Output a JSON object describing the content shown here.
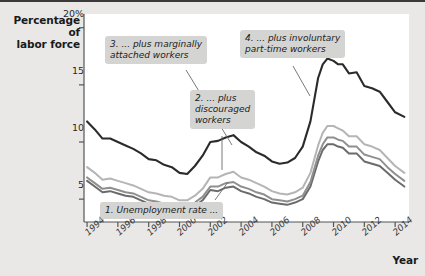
{
  "figure": {
    "y_axis_title": "Percentage of\nlabor force",
    "x_axis_title": "Year",
    "y_ticks": [
      {
        "value": 20,
        "label": "20%"
      },
      {
        "value": 15,
        "label": "15"
      },
      {
        "value": 10,
        "label": "10"
      },
      {
        "value": 5,
        "label": "5"
      }
    ],
    "x_ticks": [
      {
        "value": 1994,
        "label": "1994"
      },
      {
        "value": 1996,
        "label": "1996"
      },
      {
        "value": 1998,
        "label": "1998"
      },
      {
        "value": 2000,
        "label": "2000"
      },
      {
        "value": 2002,
        "label": "2002"
      },
      {
        "value": 2004,
        "label": "2004"
      },
      {
        "value": 2006,
        "label": "2006"
      },
      {
        "value": 2008,
        "label": "2008"
      },
      {
        "value": 2010,
        "label": "2010"
      },
      {
        "value": 2012,
        "label": "2012"
      },
      {
        "value": 2014,
        "label": "2014"
      }
    ],
    "annotations": [
      {
        "id": "note1",
        "text": "1. Unemployment rate ..."
      },
      {
        "id": "note2",
        "text": "2. ... plus\ndiscouraged\nworkers"
      },
      {
        "id": "note3",
        "text": "3. ... plus marginally\nattached workers"
      },
      {
        "id": "note4",
        "text": "4. ... plus involuntary\npart-time workers"
      }
    ],
    "colors": {
      "plot_background": "#ffffff",
      "page_background": "#e9e8e6",
      "note_background": "#d4d4d2",
      "axis": "#555555",
      "series_1": "#6b6b6b",
      "series_2": "#8f8f8f",
      "series_3": "#b5b5b5",
      "series_4": "#2b2b2b"
    }
  },
  "chart_data": {
    "type": "line",
    "title": "",
    "xlabel": "Year",
    "ylabel": "Percentage of labor force",
    "xlim": [
      1993.8,
      2014.9
    ],
    "ylim": [
      3.0,
      21.2
    ],
    "grid": false,
    "legend": "annotations-inline",
    "x": [
      1994.0,
      1994.5,
      1995.0,
      1995.5,
      1996.0,
      1996.5,
      1997.0,
      1997.5,
      1998.0,
      1998.5,
      1999.0,
      1999.5,
      2000.0,
      2000.5,
      2001.0,
      2001.5,
      2002.0,
      2002.5,
      2003.0,
      2003.5,
      2004.0,
      2004.5,
      2005.0,
      2005.5,
      2006.0,
      2006.5,
      2007.0,
      2007.5,
      2008.0,
      2008.5,
      2009.0,
      2009.3,
      2009.6,
      2010.0,
      2010.3,
      2010.6,
      2011.0,
      2011.5,
      2012.0,
      2012.5,
      2013.0,
      2013.5,
      2014.0,
      2014.6
    ],
    "series": [
      {
        "name": "1. Unemployment rate (U-3)",
        "color": "#6b6b6b",
        "values": [
          6.6,
          6.1,
          5.6,
          5.7,
          5.5,
          5.3,
          5.2,
          4.9,
          4.6,
          4.5,
          4.3,
          4.2,
          4.0,
          4.0,
          4.4,
          4.9,
          5.8,
          5.7,
          6.0,
          6.1,
          5.7,
          5.5,
          5.2,
          5.0,
          4.7,
          4.6,
          4.5,
          4.7,
          5.0,
          6.1,
          8.3,
          9.3,
          9.8,
          9.8,
          9.6,
          9.5,
          9.0,
          9.0,
          8.3,
          8.1,
          7.9,
          7.3,
          6.7,
          6.1
        ]
      },
      {
        "name": "2. ... plus discouraged workers",
        "color": "#8f8f8f",
        "values": [
          6.9,
          6.4,
          5.9,
          6.0,
          5.8,
          5.6,
          5.5,
          5.2,
          4.9,
          4.8,
          4.6,
          4.5,
          4.3,
          4.3,
          4.7,
          5.2,
          6.1,
          6.1,
          6.4,
          6.5,
          6.1,
          5.9,
          5.6,
          5.4,
          5.0,
          4.9,
          4.8,
          5.0,
          5.3,
          6.5,
          8.8,
          9.8,
          10.4,
          10.4,
          10.2,
          10.1,
          9.6,
          9.6,
          8.9,
          8.7,
          8.5,
          7.8,
          7.2,
          6.6
        ]
      },
      {
        "name": "3. ... plus marginally attached workers",
        "color": "#b5b5b5",
        "values": [
          7.8,
          7.3,
          6.7,
          6.8,
          6.6,
          6.4,
          6.2,
          5.9,
          5.6,
          5.5,
          5.3,
          5.2,
          4.9,
          4.9,
          5.3,
          5.9,
          6.9,
          6.9,
          7.2,
          7.4,
          6.9,
          6.7,
          6.4,
          6.1,
          5.7,
          5.5,
          5.4,
          5.6,
          6.0,
          7.3,
          9.7,
          10.8,
          11.4,
          11.4,
          11.2,
          11.0,
          10.5,
          10.5,
          9.8,
          9.6,
          9.3,
          8.6,
          7.9,
          7.3
        ]
      },
      {
        "name": "4. ... plus involuntary part-time workers (U-6)",
        "color": "#2b2b2b",
        "values": [
          11.8,
          11.1,
          10.3,
          10.3,
          10.0,
          9.7,
          9.4,
          9.0,
          8.5,
          8.4,
          8.0,
          7.8,
          7.3,
          7.2,
          7.9,
          8.8,
          10.0,
          10.1,
          10.4,
          10.6,
          10.0,
          9.6,
          9.1,
          8.8,
          8.3,
          8.1,
          8.2,
          8.6,
          9.6,
          11.8,
          15.6,
          16.8,
          17.3,
          17.1,
          16.8,
          16.8,
          16.0,
          16.1,
          14.9,
          14.7,
          14.4,
          13.5,
          12.6,
          12.2
        ]
      }
    ]
  }
}
